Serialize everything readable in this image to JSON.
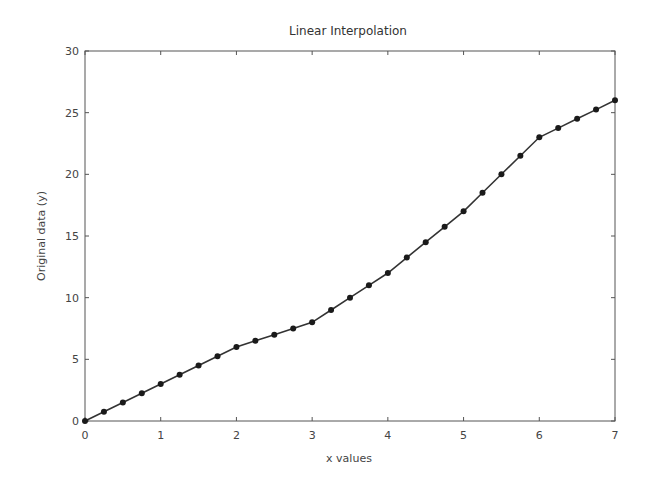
{
  "chart_data": {
    "type": "line",
    "title": "Linear Interpolation",
    "xlabel": "x values",
    "ylabel": "Original data (y)",
    "xlim": [
      0,
      7
    ],
    "ylim": [
      0,
      30
    ],
    "xticks": [
      0,
      1,
      2,
      3,
      4,
      5,
      6,
      7
    ],
    "yticks": [
      0,
      5,
      10,
      15,
      20,
      25,
      30
    ],
    "grid": false,
    "legend": null,
    "series": [
      {
        "name": "interpolated",
        "color": "#333333",
        "marker": "circle",
        "x": [
          0,
          0.25,
          0.5,
          0.75,
          1,
          1.25,
          1.5,
          1.75,
          2,
          2.25,
          2.5,
          2.75,
          3,
          3.25,
          3.5,
          3.75,
          4,
          4.25,
          4.5,
          4.75,
          5,
          5.25,
          5.5,
          5.75,
          6,
          6.25,
          6.5,
          6.75,
          7
        ],
        "y": [
          0,
          0.75,
          1.5,
          2.25,
          3,
          3.75,
          4.5,
          5.25,
          6,
          6.5,
          7,
          7.5,
          8,
          9,
          10,
          11,
          12,
          13.25,
          14.5,
          15.75,
          17,
          18.5,
          20,
          21.5,
          23,
          23.75,
          24.5,
          25.25,
          26
        ]
      }
    ]
  }
}
